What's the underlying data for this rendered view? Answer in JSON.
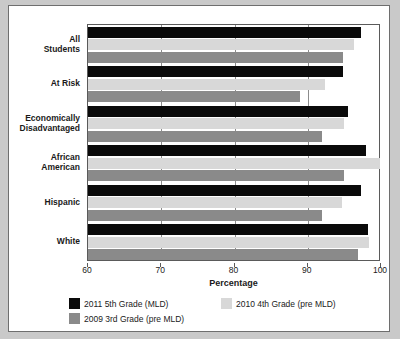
{
  "chart_data": {
    "type": "bar",
    "orientation": "horizontal",
    "title": "",
    "subtitle": "",
    "xlabel": "Percentage",
    "ylabel": "",
    "xlim": [
      60,
      100
    ],
    "xticks": [
      60,
      70,
      80,
      90,
      100
    ],
    "xticklabels": [
      "60",
      "70",
      "80",
      "90",
      "100"
    ],
    "grid": true,
    "grid_axis": "x",
    "legend_position": "below",
    "categories": [
      "All\nStudents",
      "At Risk",
      "Economically\nDisadvantaged",
      "African\nAmerican",
      "Hispanic",
      "White"
    ],
    "series": [
      {
        "name": "2011 5th Grade (MLD)",
        "color": "#0a0a0a",
        "values": [
          97.3,
          94.8,
          95.5,
          98.0,
          97.3,
          98.2
        ]
      },
      {
        "name": "2010 4th Grade (pre MLD)",
        "color": "#d8d8d8",
        "values": [
          96.3,
          92.3,
          95.0,
          99.8,
          94.7,
          98.3
        ]
      },
      {
        "name": "2009 3rd Grade (pre MLD)",
        "color": "#8a8a8a",
        "values": [
          94.8,
          89.0,
          92.0,
          95.0,
          92.0,
          96.8
        ]
      }
    ]
  },
  "legend": {
    "items": [
      {
        "label": "2011 5th Grade (MLD)",
        "swatch": "s0"
      },
      {
        "label": "2010 4th Grade (pre MLD)",
        "swatch": "s1"
      },
      {
        "label": "2009 3rd Grade (pre MLD)",
        "swatch": "s2"
      }
    ]
  },
  "axis": {
    "xlabel": "Percentage"
  }
}
